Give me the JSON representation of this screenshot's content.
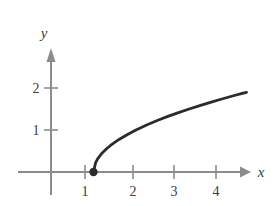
{
  "chart_data": {
    "type": "line",
    "title": "",
    "subtitle": "",
    "xlabel": "x",
    "ylabel": "y",
    "xlim": [
      -0.75,
      4.6
    ],
    "ylim": [
      -0.55,
      2.9
    ],
    "xticks": [
      1,
      2,
      3,
      4
    ],
    "xtick_labels": [
      "1",
      "2",
      "3",
      "4"
    ],
    "yticks": [
      1,
      2
    ],
    "ytick_labels": [
      "1",
      "2"
    ],
    "grid": false,
    "legend": "none",
    "annotations": [],
    "series": [
      {
        "name": "y = sqrt(x - 1)",
        "equation": "y = √(x − 1)",
        "x": [
          1.0,
          1.05,
          1.1,
          1.2,
          1.3,
          1.4,
          1.5,
          1.6,
          1.8,
          2.0,
          2.25,
          2.5,
          2.75,
          3.0,
          3.25,
          3.5,
          3.75,
          4.0,
          4.25,
          4.5,
          4.6
        ],
        "y": [
          0.0,
          0.224,
          0.316,
          0.447,
          0.548,
          0.632,
          0.707,
          0.775,
          0.894,
          1.0,
          1.118,
          1.225,
          1.323,
          1.414,
          1.5,
          1.581,
          1.658,
          1.732,
          1.803,
          1.871,
          1.897
        ],
        "color": "#2b2b2b",
        "endpoint": {
          "x": 1,
          "y": 0,
          "style": "filled-dot",
          "label": "(1, 0)"
        }
      }
    ],
    "axis_color": "#8c8c8c",
    "curve_color": "#2b2b2b",
    "x_axis_arrow": true,
    "y_axis_arrow": true
  },
  "figure": {
    "x_axis_name": "x",
    "y_axis_name": "y",
    "x_tick_1": "1",
    "x_tick_2": "2",
    "x_tick_3": "3",
    "x_tick_4": "4",
    "y_tick_1": "1",
    "y_tick_2": "2"
  }
}
